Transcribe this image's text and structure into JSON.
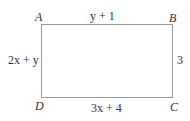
{
  "diagram": {
    "shape": "rectangle",
    "vertices": {
      "top_left": "A",
      "top_right": "B",
      "bottom_right": "C",
      "bottom_left": "D"
    },
    "sides": {
      "top": "y + 1",
      "right": "3",
      "bottom": "3x + 4",
      "left": "2x + y"
    }
  }
}
